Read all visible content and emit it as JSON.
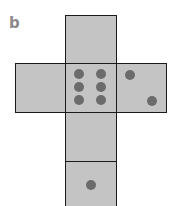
{
  "label": "b",
  "net": {
    "description": "Unfolded cube net (die)",
    "faces": [
      {
        "name": "top",
        "pips": 0
      },
      {
        "name": "left",
        "pips": 0
      },
      {
        "name": "center",
        "pips": 6
      },
      {
        "name": "right",
        "pips": 2
      },
      {
        "name": "lower",
        "pips": 0
      },
      {
        "name": "bottom",
        "pips": 1
      }
    ]
  },
  "colors": {
    "face": "#c4c4c4",
    "pip": "#6b6b6b",
    "border": "#1a1a1a",
    "label": "#8a8a8a"
  }
}
